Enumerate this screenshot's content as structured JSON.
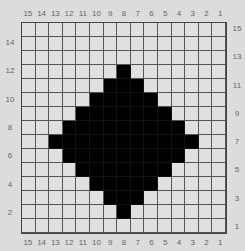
{
  "chart": {
    "title": "",
    "columns": 15,
    "rows": 15,
    "column_labels": [
      "15",
      "14",
      "13",
      "12",
      "11",
      "10",
      "9",
      "8",
      "7",
      "6",
      "5",
      "4",
      "3",
      "2",
      "1"
    ],
    "left_row_labels": [
      {
        "row": 14,
        "label": "14"
      },
      {
        "row": 12,
        "label": "12"
      },
      {
        "row": 10,
        "label": "10"
      },
      {
        "row": 8,
        "label": "8"
      },
      {
        "row": 6,
        "label": "6"
      },
      {
        "row": 4,
        "label": "4"
      },
      {
        "row": 2,
        "label": "2"
      }
    ],
    "right_row_labels": [
      {
        "row": 15,
        "label": "15"
      },
      {
        "row": 13,
        "label": "13"
      },
      {
        "row": 11,
        "label": "11"
      },
      {
        "row": 9,
        "label": "9"
      },
      {
        "row": 7,
        "label": "7"
      },
      {
        "row": 5,
        "label": "5"
      },
      {
        "row": 3,
        "label": "3"
      },
      {
        "row": 1,
        "label": "1"
      }
    ],
    "filled_rows": [
      {
        "row": 12,
        "from_col_index": 7,
        "to_col_index": 7
      },
      {
        "row": 11,
        "from_col_index": 6,
        "to_col_index": 8
      },
      {
        "row": 10,
        "from_col_index": 5,
        "to_col_index": 9
      },
      {
        "row": 9,
        "from_col_index": 4,
        "to_col_index": 10
      },
      {
        "row": 8,
        "from_col_index": 3,
        "to_col_index": 11
      },
      {
        "row": 7,
        "from_col_index": 2,
        "to_col_index": 12
      },
      {
        "row": 6,
        "from_col_index": 3,
        "to_col_index": 11
      },
      {
        "row": 5,
        "from_col_index": 4,
        "to_col_index": 10
      },
      {
        "row": 4,
        "from_col_index": 5,
        "to_col_index": 9
      },
      {
        "row": 3,
        "from_col_index": 6,
        "to_col_index": 8
      },
      {
        "row": 2,
        "from_col_index": 7,
        "to_col_index": 7
      }
    ],
    "colors": {
      "background": "#dcdcdc",
      "cell": "#e0e0e0",
      "filled": "#000000",
      "grid_line": "#555555",
      "label": "#666666"
    }
  }
}
